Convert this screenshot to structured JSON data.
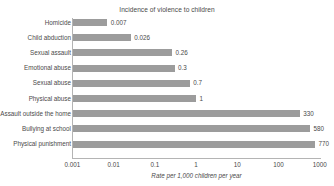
{
  "chart_data": {
    "type": "bar",
    "orientation": "horizontal",
    "title": "Incidence of violence to children",
    "xlabel": "Rate per 1,000 children per year",
    "ylabel": "",
    "xscale": "log",
    "xlim": [
      0.001,
      1000
    ],
    "xticks": [
      "0.001",
      "0.01",
      "0.1",
      "1",
      "10",
      "100",
      "1000"
    ],
    "xtick_values": [
      0.001,
      0.01,
      0.1,
      1,
      10,
      100,
      1000
    ],
    "grid": false,
    "legend": false,
    "bar_color": "#9c9c9c",
    "categories": [
      "Homicide",
      "Child abduction",
      "Sexual assault",
      "Emotional abuse",
      "Sexual abuse",
      "Physical abuse",
      "Assault outside the home",
      "Bullying at school",
      "Physical punishment"
    ],
    "values": [
      0.007,
      0.026,
      0.26,
      0.3,
      0.7,
      1,
      330,
      580,
      770
    ],
    "value_labels": [
      "0.007",
      "0.026",
      "0.26",
      "0.3",
      "0.7",
      "1",
      "330",
      "580",
      "770"
    ]
  }
}
